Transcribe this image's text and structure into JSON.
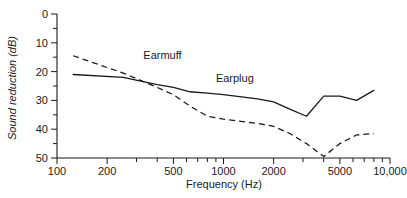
{
  "chart_data": {
    "type": "line",
    "title": "",
    "xlabel": "Frequency (Hz)",
    "ylabel": "Sound reduction (dB)",
    "xscale": "log",
    "xlim": [
      100,
      10000
    ],
    "ylim": [
      0,
      50
    ],
    "y_inverted": true,
    "grid": false,
    "legend_position": "inline-annotations",
    "xticks": [
      100,
      200,
      500,
      1000,
      2000,
      5000,
      10000
    ],
    "xtick_labels": [
      "100",
      "200",
      "500",
      "1000",
      "2000",
      "5000",
      "10,000"
    ],
    "yticks": [
      0,
      10,
      20,
      30,
      40,
      50
    ],
    "ytick_labels": [
      "0",
      "10",
      "20",
      "30",
      "40",
      "50"
    ],
    "yticks_minor": [
      5,
      15,
      25,
      35,
      45
    ],
    "xticks_minor": [
      300,
      400,
      600,
      700,
      800,
      900,
      3000,
      4000,
      6000,
      7000,
      8000,
      9000
    ],
    "series": [
      {
        "name": "Earmuff",
        "style": "dashed",
        "x": [
          125,
          250,
          400,
          500,
          630,
          800,
          1000,
          1600,
          2000,
          2500,
          3150,
          4000,
          5000,
          6300,
          8000
        ],
        "values": [
          14.5,
          20.5,
          25.5,
          28.0,
          32.0,
          35.5,
          36.5,
          38.0,
          39.0,
          41.5,
          45.0,
          49.5,
          45.0,
          42.0,
          41.5
        ]
      },
      {
        "name": "Earplug",
        "style": "solid",
        "x": [
          125,
          250,
          400,
          500,
          630,
          800,
          1000,
          1600,
          2000,
          2500,
          3150,
          4000,
          5000,
          6300,
          8000
        ],
        "values": [
          21.0,
          22.0,
          24.5,
          25.5,
          27.0,
          27.5,
          28.0,
          29.5,
          30.5,
          33.0,
          35.5,
          28.5,
          28.5,
          30.0,
          26.5
        ]
      }
    ],
    "annotations": [
      {
        "text": "Earmuff",
        "x": 330,
        "y": 15.5
      },
      {
        "text": "Earplug",
        "x": 900,
        "y": 23.5
      }
    ]
  }
}
